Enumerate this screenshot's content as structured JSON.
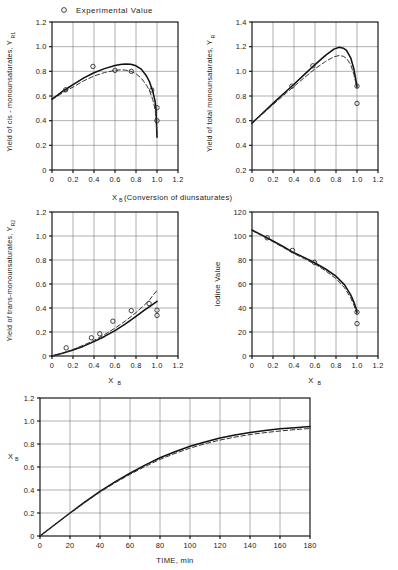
{
  "legend": {
    "marker": "circle-open-marker",
    "label": "Experimental Value"
  },
  "shared": {
    "xlabel_top": "X",
    "xlabel_top_sub": "B",
    "xlabel_top_rest": "(Conversion of diunsaturates)"
  },
  "chart_data": [
    {
      "id": "cis-monounsaturates",
      "type": "line",
      "title": "",
      "xlabel": "X_B (Conversion of diunsaturates)",
      "ylabel": "Yield of cis - monounsaturates, Y_R1",
      "ylabel_main": "Yield of cis - monounsaturates, Y",
      "ylabel_sub": "R",
      "ylabel_sub2": "1",
      "xlim": [
        0,
        1.2
      ],
      "ylim": [
        0,
        1.2
      ],
      "xticks": [
        0,
        0.2,
        0.4,
        0.6,
        0.8,
        1.0,
        1.2
      ],
      "xticklabels": [
        "0",
        "0.2",
        "0.4",
        "0.6",
        "0.8",
        "1.0",
        "1.2"
      ],
      "yticks": [
        0,
        0.2,
        0.4,
        0.6,
        0.8,
        1.0,
        1.2
      ],
      "yticklabels": [
        "0",
        "0.2",
        "0.4",
        "0.6",
        "0.8",
        "1.0",
        "1.2"
      ],
      "grid": true,
      "legend_position": "above-figure",
      "series": [
        {
          "name": "model-solid",
          "style": "solid",
          "x": [
            0.0,
            0.05,
            0.1,
            0.15,
            0.2,
            0.3,
            0.4,
            0.5,
            0.6,
            0.65,
            0.7,
            0.75,
            0.8,
            0.85,
            0.9,
            0.93,
            0.96,
            0.98,
            0.99,
            1.0
          ],
          "y": [
            0.575,
            0.605,
            0.637,
            0.665,
            0.692,
            0.745,
            0.788,
            0.822,
            0.848,
            0.856,
            0.86,
            0.857,
            0.845,
            0.818,
            0.762,
            0.712,
            0.637,
            0.565,
            0.5,
            0.265
          ]
        },
        {
          "name": "model-dashed",
          "style": "dashed",
          "x": [
            0.0,
            0.05,
            0.1,
            0.15,
            0.2,
            0.3,
            0.4,
            0.5,
            0.6,
            0.65,
            0.7,
            0.75,
            0.8,
            0.85,
            0.9,
            0.93,
            0.96,
            0.98,
            0.99,
            1.0
          ],
          "y": [
            0.57,
            0.598,
            0.625,
            0.65,
            0.672,
            0.722,
            0.762,
            0.79,
            0.808,
            0.812,
            0.81,
            0.8,
            0.78,
            0.745,
            0.688,
            0.64,
            0.57,
            0.5,
            0.44,
            0.295
          ]
        }
      ],
      "points": [
        {
          "x": 0.13,
          "y": 0.65
        },
        {
          "x": 0.39,
          "y": 0.84
        },
        {
          "x": 0.6,
          "y": 0.808
        },
        {
          "x": 0.755,
          "y": 0.8
        },
        {
          "x": 0.95,
          "y": 0.648
        },
        {
          "x": 1.0,
          "y": 0.505
        },
        {
          "x": 1.0,
          "y": 0.4
        }
      ]
    },
    {
      "id": "total-monounsaturates",
      "type": "line",
      "title": "",
      "xlabel": "X_B (Conversion of diunsaturates)",
      "ylabel": "Yield of total monounsaturates, Y_R",
      "ylabel_main": "Yield of total monounsaturates, Y",
      "ylabel_sub": "R",
      "xlim": [
        0,
        1.2
      ],
      "ylim": [
        0.2,
        1.4
      ],
      "xticks": [
        0,
        0.2,
        0.4,
        0.6,
        0.8,
        1.0,
        1.2
      ],
      "xticklabels": [
        "0",
        "0.2",
        "0.4",
        "0.6",
        "0.8",
        "1.0",
        "1.2"
      ],
      "yticks": [
        0.2,
        0.4,
        0.6,
        0.8,
        1.0,
        1.2,
        1.4
      ],
      "yticklabels": [
        "0.2",
        "0.4",
        "0.6",
        "0.8",
        "1.0",
        "1.2",
        "1.4"
      ],
      "grid": true,
      "series": [
        {
          "name": "model-solid",
          "style": "solid",
          "x": [
            0.0,
            0.1,
            0.2,
            0.3,
            0.4,
            0.5,
            0.6,
            0.7,
            0.78,
            0.83,
            0.87,
            0.9,
            0.94,
            0.97,
            1.0
          ],
          "y": [
            0.58,
            0.66,
            0.74,
            0.818,
            0.895,
            0.975,
            1.055,
            1.13,
            1.18,
            1.195,
            1.188,
            1.17,
            1.11,
            1.02,
            0.875
          ]
        },
        {
          "name": "model-dashed",
          "style": "dashed",
          "x": [
            0.0,
            0.1,
            0.2,
            0.3,
            0.4,
            0.5,
            0.6,
            0.7,
            0.78,
            0.83,
            0.87,
            0.9,
            0.94,
            0.97,
            1.0
          ],
          "y": [
            0.578,
            0.654,
            0.73,
            0.805,
            0.878,
            0.95,
            1.02,
            1.08,
            1.118,
            1.128,
            1.122,
            1.105,
            1.055,
            0.975,
            0.865
          ]
        }
      ],
      "points": [
        {
          "x": 0.38,
          "y": 0.88
        },
        {
          "x": 0.58,
          "y": 1.045
        },
        {
          "x": 1.0,
          "y": 0.88
        },
        {
          "x": 1.0,
          "y": 0.74
        }
      ]
    },
    {
      "id": "trans-monounsaturates",
      "type": "line",
      "title": "",
      "xlabel": "X_B",
      "xlabel_main": "X",
      "xlabel_sub": "B",
      "ylabel": "Yield of trans-monounsaturates, Y_R2",
      "ylabel_main": "Yield of trans-monounsaturates, Y",
      "ylabel_sub": "R",
      "ylabel_sub2": "2",
      "xlim": [
        0,
        1.2
      ],
      "ylim": [
        0,
        1.2
      ],
      "xticks": [
        0,
        0.2,
        0.4,
        0.6,
        0.8,
        1.0,
        1.2
      ],
      "xticklabels": [
        "0",
        "0.2",
        "0.4",
        "0.6",
        "0.8",
        "1.0",
        "1.2"
      ],
      "yticks": [
        0,
        0.2,
        0.4,
        0.6,
        0.8,
        1.0,
        1.2
      ],
      "yticklabels": [
        "0",
        "0.2",
        "0.4",
        "0.6",
        "0.8",
        "1.0",
        "1.2"
      ],
      "grid": true,
      "series": [
        {
          "name": "model-solid",
          "style": "solid",
          "x": [
            0.0,
            0.1,
            0.2,
            0.3,
            0.4,
            0.5,
            0.6,
            0.7,
            0.8,
            0.88,
            0.94,
            1.0
          ],
          "y": [
            0.0,
            0.022,
            0.05,
            0.082,
            0.12,
            0.163,
            0.212,
            0.268,
            0.33,
            0.382,
            0.418,
            0.455
          ]
        },
        {
          "name": "model-dashed",
          "style": "dashed",
          "x": [
            0.0,
            0.1,
            0.2,
            0.3,
            0.4,
            0.5,
            0.6,
            0.7,
            0.8,
            0.88,
            0.93,
            0.965,
            1.0
          ],
          "y": [
            0.0,
            0.024,
            0.054,
            0.09,
            0.13,
            0.178,
            0.232,
            0.292,
            0.362,
            0.425,
            0.468,
            0.51,
            0.545
          ]
        }
      ],
      "points": [
        {
          "x": 0.135,
          "y": 0.068
        },
        {
          "x": 0.375,
          "y": 0.152
        },
        {
          "x": 0.455,
          "y": 0.185
        },
        {
          "x": 0.58,
          "y": 0.29
        },
        {
          "x": 0.755,
          "y": 0.378
        },
        {
          "x": 0.925,
          "y": 0.437
        },
        {
          "x": 1.0,
          "y": 0.382
        },
        {
          "x": 1.0,
          "y": 0.338
        }
      ]
    },
    {
      "id": "iodine-value",
      "type": "line",
      "title": "",
      "xlabel": "X_B",
      "xlabel_main": "X",
      "xlabel_sub": "B",
      "ylabel": "Iodine Value",
      "xlim": [
        0,
        1.2
      ],
      "ylim": [
        0,
        120
      ],
      "xticks": [
        0,
        0.2,
        0.4,
        0.6,
        0.8,
        1.0,
        1.2
      ],
      "xticklabels": [
        "0",
        "0.2",
        "0.4",
        "0.6",
        "0.8",
        "1.0",
        "1.2"
      ],
      "yticks": [
        0,
        20,
        40,
        60,
        80,
        100,
        120
      ],
      "yticklabels": [
        "0",
        "20",
        "40",
        "60",
        "80",
        "100",
        "120"
      ],
      "grid": true,
      "series": [
        {
          "name": "model-solid",
          "style": "solid",
          "x": [
            0.0,
            0.1,
            0.2,
            0.3,
            0.4,
            0.5,
            0.6,
            0.7,
            0.8,
            0.88,
            0.94,
            0.97,
            0.99,
            1.0
          ],
          "y": [
            105.0,
            100.5,
            95.8,
            91.0,
            86.0,
            82.0,
            77.5,
            72.5,
            66.5,
            59.5,
            51.0,
            45.0,
            40.0,
            36.5
          ]
        },
        {
          "name": "model-dashed",
          "style": "dashed",
          "x": [
            0.0,
            0.1,
            0.2,
            0.3,
            0.4,
            0.5,
            0.6,
            0.7,
            0.8,
            0.88,
            0.94,
            0.97,
            0.99,
            1.0
          ],
          "y": [
            104.5,
            100.0,
            95.2,
            90.3,
            85.3,
            81.0,
            76.5,
            71.0,
            64.5,
            57.0,
            48.5,
            42.5,
            37.5,
            35.0
          ]
        }
      ],
      "points": [
        {
          "x": 0.145,
          "y": 98.5
        },
        {
          "x": 0.385,
          "y": 88.0
        },
        {
          "x": 0.595,
          "y": 78.0
        },
        {
          "x": 1.0,
          "y": 36.5
        },
        {
          "x": 1.0,
          "y": 27.0
        }
      ]
    },
    {
      "id": "conversion-vs-time",
      "type": "line",
      "title": "",
      "xlabel": "TIME, min",
      "ylabel": "X_B",
      "ylabel_main": "X",
      "ylabel_sub": "B",
      "xlim": [
        0,
        180
      ],
      "ylim": [
        0,
        1.2
      ],
      "xticks": [
        0,
        20,
        40,
        60,
        80,
        100,
        120,
        140,
        160,
        180
      ],
      "xticklabels": [
        "0",
        "20",
        "40",
        "60",
        "80",
        "100",
        "120",
        "140",
        "160",
        "180"
      ],
      "yticks": [
        0,
        0.2,
        0.4,
        0.6,
        0.8,
        1.0,
        1.2
      ],
      "yticklabels": [
        "0",
        "0.2",
        "0.4",
        "0.6",
        "0.8",
        "1.0",
        "1.2"
      ],
      "grid": true,
      "series": [
        {
          "name": "model-solid",
          "style": "solid",
          "x": [
            0,
            10,
            20,
            30,
            40,
            50,
            60,
            70,
            80,
            90,
            100,
            110,
            120,
            130,
            140,
            150,
            160,
            170,
            180
          ],
          "y": [
            0.0,
            0.1,
            0.2,
            0.296,
            0.388,
            0.47,
            0.546,
            0.616,
            0.68,
            0.733,
            0.78,
            0.818,
            0.852,
            0.878,
            0.9,
            0.918,
            0.932,
            0.942,
            0.952
          ]
        },
        {
          "name": "model-dashed",
          "style": "dashed",
          "x": [
            0,
            10,
            20,
            30,
            40,
            50,
            60,
            70,
            80,
            90,
            100,
            110,
            120,
            130,
            140,
            150,
            160,
            170,
            180
          ],
          "y": [
            0.0,
            0.099,
            0.198,
            0.292,
            0.382,
            0.462,
            0.536,
            0.604,
            0.666,
            0.718,
            0.764,
            0.802,
            0.834,
            0.86,
            0.882,
            0.899,
            0.913,
            0.925,
            0.935
          ]
        }
      ],
      "points": []
    }
  ]
}
